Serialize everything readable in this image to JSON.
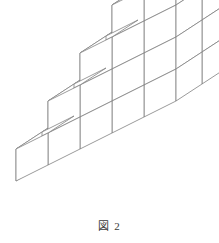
{
  "figure": {
    "caption": "図 2",
    "caption_label": "図",
    "caption_number": "2",
    "background_color": "#ffffff",
    "line_color": "#808080",
    "face_color": "#ffffff",
    "line_width": 0.8
  },
  "diagram": {
    "type": "isometric-cube-stack",
    "projection": "isometric",
    "unit_cube_px": 32,
    "columns": 5,
    "depth_rows": 2,
    "max_height": 5,
    "column_heights": [
      1,
      2,
      3,
      4,
      5
    ],
    "total_cubes": 30,
    "geometry": {
      "origin_x": 16,
      "origin_y": 181,
      "step_x": 32,
      "step_y": -16,
      "depth_x": 26,
      "depth_y": -17,
      "cube_height": 32
    }
  }
}
